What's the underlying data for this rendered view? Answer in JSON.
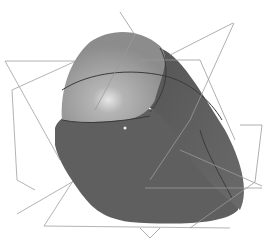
{
  "figure": {
    "colors": {
      "background": "#ffffff",
      "light_surface": "#a8a8a8",
      "mid_surface": "#8a8a8a",
      "dark_surface": "#5e5e5e",
      "plane_lines": "#9a9a9a",
      "edge_lines": "#3c3c3c"
    }
  }
}
